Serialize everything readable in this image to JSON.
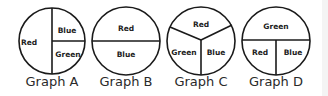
{
  "graphs": [
    {
      "title": "Graph A",
      "segments": [
        "Red",
        "Blue",
        "Green"
      ]
    },
    {
      "title": "Graph B",
      "segments": [
        "Red",
        "Blue"
      ]
    },
    {
      "title": "Graph C",
      "segments": [
        "Red",
        "Green",
        "Blue"
      ]
    },
    {
      "title": "Graph D",
      "segments": [
        "Green",
        "Red",
        "Blue"
      ]
    }
  ],
  "colors": {
    "stroke": "#1a1a1a",
    "text": "#222222",
    "background": "#ffffff"
  }
}
